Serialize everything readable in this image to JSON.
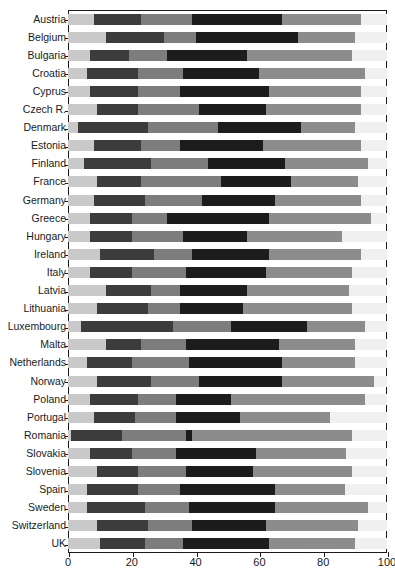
{
  "chart_data": {
    "type": "bar",
    "subtype": "stacked-horizontal-bar",
    "title": "",
    "xlabel": "",
    "ylabel": "",
    "xlim": [
      0,
      100
    ],
    "xticks": [
      0,
      20,
      40,
      60,
      80,
      100
    ],
    "xtick_labels": [
      "0",
      "20",
      "40",
      "60",
      "80",
      "100"
    ],
    "grid": false,
    "legend": "none",
    "orientation": "horizontal",
    "stacked": true,
    "categories": [
      "Austria",
      "Belgium",
      "Bulgaria",
      "Croatia",
      "Cyprus",
      "Czech R.",
      "Denmark",
      "Estonia",
      "Finland",
      "France",
      "Germany",
      "Greece",
      "Hungary",
      "Ireland",
      "Italy",
      "Latvia",
      "Lithuania",
      "Luxembourg",
      "Malta",
      "Netherlands",
      "Norway",
      "Poland",
      "Portugal",
      "Romania",
      "Slovakia",
      "Slovenia",
      "Spain",
      "Sweden",
      "Switzerland",
      "UK"
    ],
    "series": [
      {
        "name": "segment-1",
        "color": "#c9c9c9",
        "values": [
          8,
          12,
          7,
          6,
          7,
          9,
          3,
          8,
          5,
          9,
          8,
          7,
          7,
          10,
          7,
          12,
          9,
          4,
          12,
          6,
          9,
          7,
          8,
          1,
          7,
          9,
          6,
          6,
          9,
          10
        ]
      },
      {
        "name": "segment-2",
        "color": "#3c3c3c",
        "values": [
          15,
          18,
          12,
          16,
          15,
          13,
          22,
          15,
          21,
          14,
          16,
          13,
          13,
          17,
          13,
          14,
          16,
          29,
          11,
          14,
          17,
          15,
          13,
          16,
          13,
          13,
          16,
          18,
          16,
          14
        ]
      },
      {
        "name": "segment-3",
        "color": "#7d7d7d",
        "values": [
          16,
          10,
          12,
          14,
          13,
          19,
          22,
          12,
          18,
          25,
          18,
          11,
          16,
          12,
          17,
          9,
          10,
          18,
          14,
          18,
          15,
          12,
          13,
          20,
          14,
          15,
          13,
          14,
          14,
          12
        ]
      },
      {
        "name": "segment-4",
        "color": "#1c1c1c",
        "values": [
          28,
          32,
          25,
          24,
          28,
          21,
          26,
          26,
          24,
          22,
          23,
          32,
          20,
          24,
          25,
          21,
          20,
          24,
          29,
          29,
          26,
          17,
          20,
          2,
          25,
          21,
          30,
          27,
          23,
          27
        ]
      },
      {
        "name": "segment-5",
        "color": "#8c8c8c",
        "values": [
          25,
          18,
          33,
          33,
          29,
          30,
          17,
          31,
          26,
          21,
          27,
          32,
          30,
          29,
          27,
          32,
          34,
          18,
          24,
          23,
          29,
          42,
          28,
          50,
          28,
          31,
          22,
          29,
          29,
          27
        ]
      }
    ]
  }
}
